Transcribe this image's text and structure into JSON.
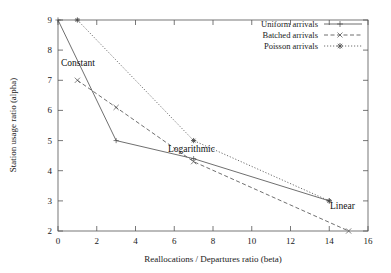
{
  "chart_data": {
    "type": "line",
    "title": "",
    "xlabel": "Reallocations / Departures ratio (beta)",
    "ylabel": "Station usage ratio (alpha)",
    "xlim": [
      0,
      16
    ],
    "ylim": [
      2,
      9
    ],
    "xticks": [
      0,
      2,
      4,
      6,
      8,
      10,
      12,
      14,
      16
    ],
    "yticks": [
      2,
      3,
      4,
      5,
      6,
      7,
      8,
      9
    ],
    "grid": false,
    "legend_position": "top-right",
    "series": [
      {
        "name": "Uniform arrivals",
        "style": "solid",
        "marker": "plus",
        "x": [
          0,
          3,
          7,
          14
        ],
        "y": [
          9,
          5,
          4.4,
          3
        ]
      },
      {
        "name": "Batched arrivals",
        "style": "dashed",
        "marker": "cross",
        "x": [
          1,
          3,
          7,
          15
        ],
        "y": [
          7,
          6.1,
          4.3,
          2
        ]
      },
      {
        "name": "Poisson arrivals",
        "style": "dotted",
        "marker": "star",
        "x": [
          1,
          7,
          14
        ],
        "y": [
          9,
          5,
          3
        ]
      }
    ],
    "annotations": [
      {
        "text": "Constant",
        "x": 0.25,
        "y": 7.55
      },
      {
        "text": "Logarithmic",
        "x": 5.6,
        "y": 4.45
      },
      {
        "text": "Linear",
        "x": 13.2,
        "y": 2.6
      }
    ]
  },
  "legend": {
    "items": [
      {
        "label": "Uniform arrivals"
      },
      {
        "label": "Batched arrivals"
      },
      {
        "label": "Poisson arrivals"
      }
    ]
  },
  "axes": {
    "x_title": "Reallocations / Departures ratio (beta)",
    "y_title": "Station usage ratio (alpha)",
    "x_tick_labels": [
      "0",
      "2",
      "4",
      "6",
      "8",
      "10",
      "12",
      "14",
      "16"
    ],
    "y_tick_labels": [
      "2",
      "3",
      "4",
      "5",
      "6",
      "7",
      "8",
      "9"
    ]
  },
  "annotations": {
    "constant": "Constant",
    "logarithmic": "Logarithmic",
    "linear": "Linear"
  },
  "colors": {
    "line": "#4a4a4a",
    "axis": "#555555",
    "text": "#1a1a1a",
    "background": "#ffffff"
  }
}
